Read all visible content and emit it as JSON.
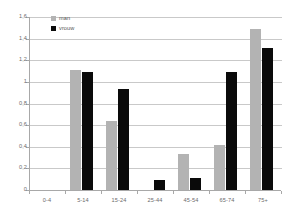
{
  "chart_data": {
    "type": "bar",
    "title": "",
    "subtitle": "",
    "xlabel": "",
    "ylabel": "",
    "categories": [
      "0-4",
      "5-14",
      "15-24",
      "25-44",
      "45-54",
      "65-74",
      "75+"
    ],
    "series": [
      {
        "name": "man",
        "color": "#b3b3b3",
        "values": [
          0,
          1.11,
          0.64,
          0,
          0.33,
          0.42,
          1.49
        ]
      },
      {
        "name": "vrouw",
        "color": "#0a0a0a",
        "values": [
          0,
          1.09,
          0.93,
          0.09,
          0.11,
          1.09,
          1.31
        ]
      }
    ],
    "ylim": [
      0,
      1.6
    ],
    "ytick_values": [
      0,
      0.2,
      0.4,
      0.6,
      0.8,
      1.0,
      1.2,
      1.4,
      1.6
    ],
    "ytick_labels": [
      "0",
      "0,2",
      "0,4",
      "0,6",
      "0,8",
      "1",
      "1,2",
      "1,4",
      "1,6"
    ],
    "grid": true,
    "grid_axis": "y",
    "legend_position": "top-left",
    "annotations": []
  },
  "legend": {
    "entries": [
      {
        "label": "man"
      },
      {
        "label": "vrouw"
      }
    ]
  }
}
